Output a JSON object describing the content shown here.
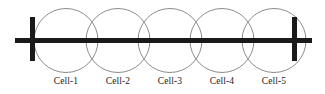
{
  "figure": {
    "width": 325,
    "height": 94,
    "background_color": "#ffffff"
  },
  "axis": {
    "name": "horizontal-road-line",
    "color": "#1a1a1a",
    "x_start": 15,
    "x_end": 312,
    "y_center": 40.5,
    "thickness": 5
  },
  "endpoints": [
    {
      "name": "left-endpoint-bar",
      "x": 32.5,
      "y_top": 17,
      "y_bottom": 61,
      "thickness": 5,
      "color": "#1a1a1a"
    },
    {
      "name": "right-endpoint-bar",
      "x": 294.5,
      "y_top": 17,
      "y_bottom": 61,
      "thickness": 5,
      "color": "#1a1a1a"
    }
  ],
  "cells": [
    {
      "label": "Cell-1",
      "cx": 66,
      "cy": 40.5,
      "r": 32,
      "label_x": 66,
      "label_y": 84
    },
    {
      "label": "Cell-2",
      "cx": 118,
      "cy": 40.5,
      "r": 32,
      "label_x": 118,
      "label_y": 84
    },
    {
      "label": "Cell-3",
      "cx": 170,
      "cy": 40.5,
      "r": 32,
      "label_x": 170,
      "label_y": 84
    },
    {
      "label": "Cell-4",
      "cx": 222,
      "cy": 40.5,
      "r": 32,
      "label_x": 222,
      "label_y": 84
    },
    {
      "label": "Cell-5",
      "cx": 274,
      "cy": 40.5,
      "r": 32,
      "label_x": 274,
      "label_y": 84
    }
  ],
  "style": {
    "circle_stroke": "#6e6e6e",
    "circle_stroke_width": 0.8,
    "circle_fill": "none",
    "label_color": "#1a1a1a",
    "label_font_size": 9.5
  }
}
